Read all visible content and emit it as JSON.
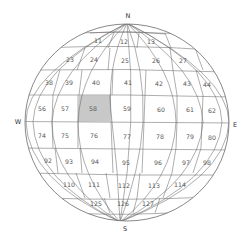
{
  "diagram": {
    "type": "globe-grid",
    "compass": {
      "north": "N",
      "south": "S",
      "west": "W",
      "east": "E"
    },
    "highlight_color": "#c8c8c8",
    "highlighted_cell": "58",
    "rows": [
      {
        "cells": [
          "11",
          "12",
          "13"
        ]
      },
      {
        "cells": [
          "23",
          "24",
          "25",
          "26",
          "27"
        ]
      },
      {
        "cells": [
          "38",
          "39",
          "40",
          "41",
          "42",
          "43",
          "44"
        ]
      },
      {
        "cells": [
          "56",
          "57",
          "58",
          "59",
          "60",
          "61",
          "62"
        ]
      },
      {
        "cells": [
          "74",
          "75",
          "76",
          "77",
          "78",
          "79",
          "80"
        ]
      },
      {
        "cells": [
          "92",
          "93",
          "94",
          "95",
          "96",
          "97",
          "98"
        ]
      },
      {
        "cells": [
          "110",
          "111",
          "112",
          "113",
          "114"
        ]
      },
      {
        "cells": [
          "125",
          "126",
          "127"
        ]
      }
    ],
    "labels": [
      {
        "id": "c11",
        "text": "11",
        "x": 98,
        "y": 41
      },
      {
        "id": "c12",
        "text": "12",
        "x": 124,
        "y": 42
      },
      {
        "id": "c13",
        "text": "13",
        "x": 151,
        "y": 42
      },
      {
        "id": "c23",
        "text": "23",
        "x": 70,
        "y": 60
      },
      {
        "id": "c24",
        "text": "24",
        "x": 94,
        "y": 60
      },
      {
        "id": "c25",
        "text": "25",
        "x": 125,
        "y": 61
      },
      {
        "id": "c26",
        "text": "26",
        "x": 156,
        "y": 61
      },
      {
        "id": "c27",
        "text": "27",
        "x": 183,
        "y": 61
      },
      {
        "id": "c38",
        "text": "38",
        "x": 49,
        "y": 83
      },
      {
        "id": "c39",
        "text": "39",
        "x": 69,
        "y": 83
      },
      {
        "id": "c40",
        "text": "40",
        "x": 96,
        "y": 83
      },
      {
        "id": "c41",
        "text": "41",
        "x": 128,
        "y": 83
      },
      {
        "id": "c42",
        "text": "42",
        "x": 159,
        "y": 84
      },
      {
        "id": "c43",
        "text": "43",
        "x": 187,
        "y": 84
      },
      {
        "id": "c44",
        "text": "44",
        "x": 207,
        "y": 85
      },
      {
        "id": "c56",
        "text": "56",
        "x": 42,
        "y": 109
      },
      {
        "id": "c57",
        "text": "57",
        "x": 65,
        "y": 109
      },
      {
        "id": "c58",
        "text": "58",
        "x": 93,
        "y": 109
      },
      {
        "id": "c59",
        "text": "59",
        "x": 127,
        "y": 109
      },
      {
        "id": "c60",
        "text": "60",
        "x": 161,
        "y": 110
      },
      {
        "id": "c61",
        "text": "61",
        "x": 190,
        "y": 110
      },
      {
        "id": "c62",
        "text": "62",
        "x": 212,
        "y": 111
      },
      {
        "id": "c74",
        "text": "74",
        "x": 42,
        "y": 136
      },
      {
        "id": "c75",
        "text": "75",
        "x": 65,
        "y": 136
      },
      {
        "id": "c76",
        "text": "76",
        "x": 94,
        "y": 136
      },
      {
        "id": "c77",
        "text": "77",
        "x": 127,
        "y": 137
      },
      {
        "id": "c78",
        "text": "78",
        "x": 160,
        "y": 137
      },
      {
        "id": "c79",
        "text": "79",
        "x": 190,
        "y": 137
      },
      {
        "id": "c80",
        "text": "80",
        "x": 212,
        "y": 138
      },
      {
        "id": "c92",
        "text": "92",
        "x": 48,
        "y": 161
      },
      {
        "id": "c93",
        "text": "93",
        "x": 69,
        "y": 162
      },
      {
        "id": "c94",
        "text": "94",
        "x": 95,
        "y": 162
      },
      {
        "id": "c95",
        "text": "95",
        "x": 126,
        "y": 163
      },
      {
        "id": "c96",
        "text": "96",
        "x": 158,
        "y": 163
      },
      {
        "id": "c97",
        "text": "97",
        "x": 186,
        "y": 163
      },
      {
        "id": "c98",
        "text": "98",
        "x": 207,
        "y": 163
      },
      {
        "id": "c110",
        "text": "110",
        "x": 69,
        "y": 185
      },
      {
        "id": "c111",
        "text": "111",
        "x": 94,
        "y": 185
      },
      {
        "id": "c112",
        "text": "112",
        "x": 124,
        "y": 186
      },
      {
        "id": "c113",
        "text": "113",
        "x": 154,
        "y": 186
      },
      {
        "id": "c114",
        "text": "114",
        "x": 180,
        "y": 185
      },
      {
        "id": "c125",
        "text": "125",
        "x": 96,
        "y": 204
      },
      {
        "id": "c126",
        "text": "126",
        "x": 123,
        "y": 204
      },
      {
        "id": "c127",
        "text": "127",
        "x": 148,
        "y": 204
      }
    ]
  }
}
